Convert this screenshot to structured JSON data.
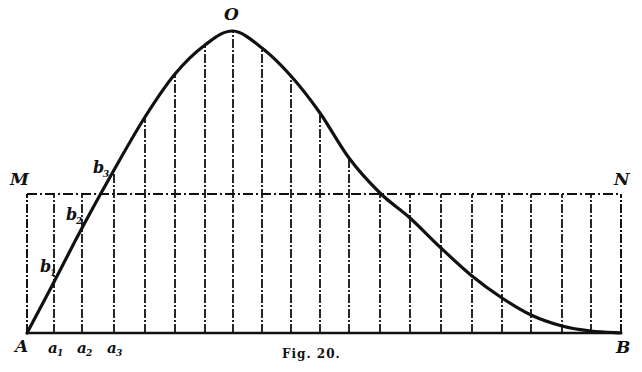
{
  "figure": {
    "caption": "Fig. 20.",
    "colors": {
      "ink": "#111111",
      "background": "#ffffff"
    }
  },
  "labels": {
    "peak": "O",
    "left_top": "M",
    "right_top": "N",
    "origin": "A",
    "end": "B",
    "b1": "b",
    "b1_sub": "1",
    "b2": "b",
    "b2_sub": "2",
    "b3": "b",
    "b3_sub": "3",
    "a1": "a",
    "a1_sub": "1",
    "a2": "a",
    "a2_sub": "2",
    "a3": "a",
    "a3_sub": "3"
  },
  "geometry": {
    "baseline_y": 333,
    "mn_line_y": 194,
    "x_start": 27,
    "x_end": 621,
    "vertical_lines_x": [
      27,
      54,
      82,
      114,
      145,
      175,
      205,
      233,
      262,
      291,
      320,
      349,
      380,
      410,
      441,
      472,
      502,
      531,
      562,
      591,
      621
    ],
    "curve_points": [
      [
        27,
        333
      ],
      [
        54,
        282
      ],
      [
        82,
        228
      ],
      [
        114,
        170
      ],
      [
        145,
        117
      ],
      [
        175,
        74
      ],
      [
        205,
        45
      ],
      [
        233,
        31
      ],
      [
        262,
        48
      ],
      [
        291,
        76
      ],
      [
        320,
        113
      ],
      [
        349,
        158
      ],
      [
        380,
        193
      ],
      [
        410,
        218
      ],
      [
        441,
        248
      ],
      [
        472,
        276
      ],
      [
        502,
        298
      ],
      [
        531,
        315
      ],
      [
        562,
        326
      ],
      [
        591,
        331
      ],
      [
        621,
        333
      ]
    ]
  }
}
